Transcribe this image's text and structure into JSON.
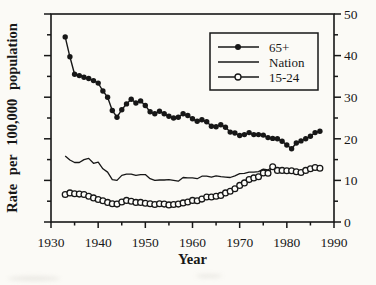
{
  "page": {
    "background": "#fbfaf6",
    "ink": "#171717"
  },
  "chart_data": {
    "type": "line",
    "title": "",
    "xlabel": "Year",
    "ylabel": "Rate per 100,000 population",
    "xlim": [
      1930,
      1990
    ],
    "ylim": [
      0,
      50
    ],
    "x_major_tick_step": 10,
    "x_minor_tick_step": 5,
    "y_major_tick_step": 10,
    "y_minor_tick_step": 5,
    "x_major_tick_labels": [
      "1930",
      "1940",
      "1950",
      "1960",
      "1970",
      "1980",
      "1990"
    ],
    "y_major_tick_labels": [
      "0",
      "10",
      "20",
      "30",
      "40",
      "50"
    ],
    "y_axis_label_side": "right",
    "grid": false,
    "legend": {
      "position": "top-right",
      "entries": [
        "65+",
        "Nation",
        "15-24"
      ]
    },
    "x": [
      1933,
      1934,
      1935,
      1936,
      1937,
      1938,
      1939,
      1940,
      1941,
      1942,
      1943,
      1944,
      1945,
      1946,
      1947,
      1948,
      1949,
      1950,
      1951,
      1952,
      1953,
      1954,
      1955,
      1956,
      1957,
      1958,
      1959,
      1960,
      1961,
      1962,
      1963,
      1964,
      1965,
      1966,
      1967,
      1968,
      1969,
      1970,
      1971,
      1972,
      1973,
      1974,
      1975,
      1976,
      1977,
      1978,
      1979,
      1980,
      1981,
      1982,
      1983,
      1984,
      1985,
      1986,
      1987
    ],
    "series": [
      {
        "name": "65+",
        "marker": "filled-circle",
        "values": [
          44.5,
          39.7,
          35.5,
          35.2,
          34.8,
          34.5,
          34.0,
          33.4,
          31.5,
          30.0,
          26.8,
          25.2,
          27.0,
          28.4,
          29.5,
          28.6,
          29.1,
          28.0,
          26.5,
          26.0,
          26.6,
          26.0,
          25.4,
          25.0,
          25.2,
          26.0,
          25.6,
          24.8,
          24.2,
          24.6,
          24.1,
          23.0,
          22.9,
          23.4,
          22.8,
          21.6,
          21.4,
          20.8,
          21.0,
          21.5,
          21.0,
          21.0,
          20.9,
          20.3,
          20.1,
          20.0,
          19.4,
          18.5,
          17.6,
          19.0,
          19.5,
          20.0,
          20.6,
          21.5,
          21.8
        ]
      },
      {
        "name": "Nation",
        "marker": "none",
        "values": [
          15.9,
          14.9,
          14.3,
          14.3,
          15.0,
          15.3,
          14.1,
          14.4,
          12.8,
          12.0,
          10.2,
          10.0,
          11.2,
          11.5,
          11.5,
          11.2,
          11.4,
          11.4,
          10.4,
          10.0,
          10.1,
          10.1,
          10.2,
          10.0,
          9.8,
          10.7,
          10.6,
          10.6,
          10.4,
          11.0,
          11.0,
          10.8,
          11.1,
          10.9,
          10.8,
          10.7,
          11.1,
          11.6,
          11.7,
          12.0,
          12.0,
          12.1,
          12.7,
          12.5,
          13.3,
          12.5,
          12.1,
          11.9,
          12.0,
          12.2,
          12.1,
          12.4,
          12.3,
          12.8,
          12.7
        ]
      },
      {
        "name": "15-24",
        "marker": "open-circle",
        "values": [
          6.6,
          7.0,
          6.8,
          6.7,
          6.6,
          6.2,
          5.8,
          5.4,
          5.1,
          4.7,
          4.4,
          4.3,
          4.8,
          5.2,
          5.0,
          4.7,
          4.7,
          4.5,
          4.4,
          4.2,
          4.4,
          4.3,
          4.1,
          4.2,
          4.3,
          4.6,
          4.8,
          5.2,
          5.1,
          5.5,
          6.0,
          6.0,
          6.2,
          6.4,
          7.0,
          7.4,
          8.0,
          8.8,
          9.4,
          10.2,
          10.6,
          10.9,
          11.8,
          11.7,
          13.3,
          12.4,
          12.4,
          12.3,
          12.3,
          12.1,
          11.9,
          12.4,
          12.8,
          13.1,
          12.9
        ]
      }
    ]
  }
}
